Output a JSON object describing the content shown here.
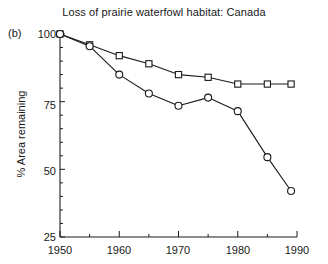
{
  "figure": {
    "panel_label": "(b)",
    "title": "Loss of prairie waterfowl habitat: Canada"
  },
  "axes": {
    "ylabel": "% Area remaining",
    "xlabel": "",
    "ytick_labels": [
      "100",
      "75",
      "50",
      "25"
    ],
    "xtick_labels": [
      "1950",
      "1960",
      "1970",
      "1980",
      "1990"
    ]
  },
  "chart_data": {
    "type": "line",
    "title": "Loss of prairie waterfowl habitat: Canada",
    "panel": "(b)",
    "xlabel": "",
    "ylabel": "% Area remaining",
    "xlim": [
      1950,
      1990
    ],
    "ylim": [
      25,
      100
    ],
    "yticks": [
      25,
      50,
      75,
      100
    ],
    "xticks": [
      1950,
      1960,
      1970,
      1980,
      1990
    ],
    "xminor_ticks": [
      1955,
      1965,
      1975,
      1985
    ],
    "grid": false,
    "legend": "none",
    "series": [
      {
        "name": "Upper series",
        "marker": "square",
        "color": "#1a1a1a",
        "x": [
          1950,
          1955,
          1960,
          1965,
          1970,
          1975,
          1980,
          1985,
          1989
        ],
        "values": [
          100,
          96,
          92,
          89,
          85,
          84,
          81.5,
          81.5,
          81.5
        ]
      },
      {
        "name": "Lower series",
        "marker": "circle",
        "color": "#1a1a1a",
        "x": [
          1950,
          1955,
          1960,
          1965,
          1970,
          1975,
          1980,
          1985,
          1989
        ],
        "values": [
          100,
          95.5,
          85,
          78,
          73.5,
          76.5,
          71.5,
          54.5,
          42
        ]
      }
    ]
  }
}
